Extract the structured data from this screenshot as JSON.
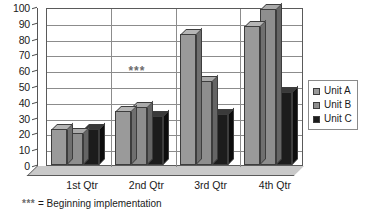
{
  "chart_data": {
    "type": "bar",
    "title": "",
    "subtitle": "",
    "xlabel": "",
    "ylabel": "",
    "categories": [
      "1st Qtr",
      "2nd Qtr",
      "3rd Qtr",
      "4th Qtr"
    ],
    "series": [
      {
        "name": "Unit A",
        "color": "#9a9a9a",
        "values": [
          23,
          34,
          83,
          88
        ]
      },
      {
        "name": "Unit B",
        "color": "#8e8e8e",
        "values": [
          20,
          37,
          53,
          99
        ]
      },
      {
        "name": "Unit C",
        "color": "#1c1c1c",
        "values": [
          23,
          31,
          32,
          46
        ]
      }
    ],
    "ylim": [
      0,
      100
    ],
    "ytick_step": 10,
    "yticks": [
      0,
      10,
      20,
      30,
      40,
      50,
      60,
      70,
      80,
      90,
      100
    ],
    "ytick_labels": [
      "0",
      "10",
      "20",
      "30",
      "40",
      "50",
      "60",
      "70",
      "80",
      "90",
      "100"
    ],
    "grid": true,
    "grid_axis": "y",
    "legend_position": "right",
    "style": "3d-column",
    "annotations": [
      {
        "text": "***",
        "category_position": 1.5,
        "value": 60
      }
    ]
  },
  "legend": {
    "items": [
      {
        "label": "Unit A",
        "color": "#9a9a9a"
      },
      {
        "label": "Unit B",
        "color": "#8e8e8e"
      },
      {
        "label": "Unit C",
        "color": "#1c1c1c"
      }
    ]
  },
  "footnote": {
    "stars": "***",
    "text": " = Beginning implementation"
  }
}
